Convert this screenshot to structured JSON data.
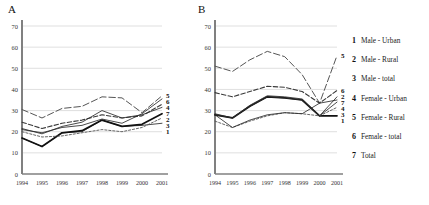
{
  "figure": {
    "panels": [
      {
        "id": "A",
        "label": "A"
      },
      {
        "id": "B",
        "label": "B"
      }
    ]
  },
  "legend": {
    "position": "right",
    "entries": [
      {
        "num": "1",
        "label": "Male - Urban"
      },
      {
        "num": "2",
        "label": "Male - Rural"
      },
      {
        "num": "3",
        "label": "Male - total"
      },
      {
        "num": "4",
        "label": "Female - Urban"
      },
      {
        "num": "5",
        "label": "Female - Rural"
      },
      {
        "num": "6",
        "label": "Female - total"
      },
      {
        "num": "7",
        "label": "Total"
      }
    ]
  },
  "chart_data": [
    {
      "type": "line",
      "title": "A",
      "xlabel": "",
      "ylabel": "",
      "x": [
        "1994",
        "1995",
        "1996",
        "1997",
        "1998",
        "1999",
        "2000",
        "2001"
      ],
      "ylim": [
        0,
        70
      ],
      "yticks": [
        0,
        10,
        20,
        30,
        40,
        50,
        60,
        70
      ],
      "grid": true,
      "legend_position": "right-of-figure",
      "endpoint_label_order": [
        "5",
        "6",
        "4",
        "7",
        "2",
        "3",
        "1"
      ],
      "series": [
        {
          "name": "Male - Urban",
          "num": "1",
          "style": "solid-thin",
          "values": [
            17.0,
            13.0,
            19.5,
            20.0,
            25.5,
            22.5,
            23.0,
            24.0
          ]
        },
        {
          "name": "Male - Rural",
          "num": "2",
          "style": "solid-thick",
          "values": [
            17.0,
            13.0,
            19.5,
            20.5,
            25.5,
            22.5,
            23.5,
            28.5
          ]
        },
        {
          "name": "Male - total",
          "num": "3",
          "style": "dashed-short",
          "values": [
            20.0,
            17.5,
            18.0,
            19.5,
            21.0,
            20.0,
            22.0,
            26.5
          ]
        },
        {
          "name": "Female - Urban",
          "num": "4",
          "style": "dashed-medium",
          "values": [
            24.5,
            21.5,
            24.0,
            25.5,
            28.0,
            26.5,
            27.5,
            33.0
          ]
        },
        {
          "name": "Female - Rural",
          "num": "5",
          "style": "dashed-long",
          "values": [
            30.5,
            26.5,
            31.0,
            32.0,
            36.5,
            36.0,
            29.0,
            37.0
          ]
        },
        {
          "name": "Female - total",
          "num": "6",
          "style": "solid-thin",
          "values": [
            21.0,
            19.5,
            22.0,
            23.0,
            26.0,
            24.0,
            28.5,
            35.5
          ]
        },
        {
          "name": "Total",
          "num": "7",
          "style": "solid-thin",
          "values": [
            21.5,
            19.0,
            22.5,
            24.5,
            30.0,
            26.5,
            28.0,
            31.5
          ]
        }
      ]
    },
    {
      "type": "line",
      "title": "B",
      "xlabel": "",
      "ylabel": "",
      "x": [
        "1994",
        "1995",
        "1996",
        "1997",
        "1998",
        "1999",
        "2000",
        "2001"
      ],
      "ylim": [
        0,
        70
      ],
      "yticks": [
        0,
        10,
        20,
        30,
        40,
        50,
        60,
        70
      ],
      "grid": true,
      "legend_position": "right-of-figure",
      "endpoint_label_order": [
        "5",
        "6",
        "2",
        "7",
        "4",
        "3",
        "1"
      ],
      "series": [
        {
          "name": "Male - Urban",
          "num": "1",
          "style": "solid-thick",
          "values": [
            28.0,
            26.5,
            32.0,
            36.5,
            36.0,
            35.0,
            27.5,
            27.5
          ]
        },
        {
          "name": "Male - Rural",
          "num": "2",
          "style": "solid-thin",
          "values": [
            28.5,
            26.5,
            32.5,
            37.0,
            36.5,
            35.5,
            27.5,
            36.5
          ]
        },
        {
          "name": "Male - total",
          "num": "3",
          "style": "dashed-short",
          "values": [
            25.0,
            22.0,
            25.0,
            27.5,
            29.0,
            28.5,
            27.5,
            31.5
          ]
        },
        {
          "name": "Female - Urban",
          "num": "4",
          "style": "solid-thin",
          "values": [
            28.0,
            26.5,
            32.0,
            36.5,
            36.0,
            35.0,
            27.5,
            34.0
          ]
        },
        {
          "name": "Female - Rural",
          "num": "5",
          "style": "dashed-long",
          "values": [
            51.0,
            48.5,
            54.0,
            58.0,
            55.5,
            47.0,
            33.5,
            56.0
          ]
        },
        {
          "name": "Female - total",
          "num": "6",
          "style": "dashed-medium",
          "values": [
            38.5,
            36.5,
            39.0,
            41.5,
            41.0,
            39.0,
            33.5,
            39.5
          ]
        },
        {
          "name": "Total",
          "num": "7",
          "style": "solid-thin",
          "values": [
            28.0,
            22.0,
            25.5,
            28.0,
            29.0,
            28.5,
            33.5,
            35.0
          ]
        }
      ]
    }
  ]
}
